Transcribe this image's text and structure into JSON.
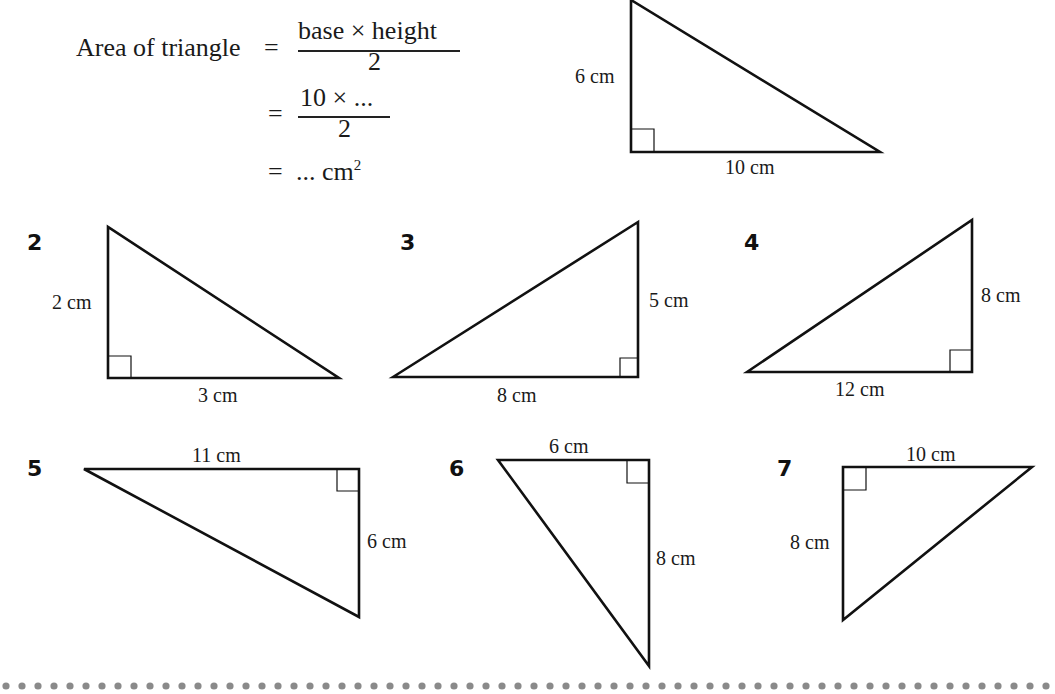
{
  "heading": {
    "text": "Copy and complete"
  },
  "worked_example": {
    "line1_label": "Area of triangle",
    "equals": "=",
    "line1_numerator": "base × height",
    "line1_denominator": "2",
    "line2_numerator": "10 × ...",
    "line2_denominator": "2",
    "line3_value": "... cm",
    "line3_superscript": "2"
  },
  "example_triangle": {
    "height_label": "6 cm",
    "base_label": "10 cm"
  },
  "questions": [
    {
      "number": "2",
      "labels": [
        "2 cm",
        "3 cm"
      ]
    },
    {
      "number": "3",
      "labels": [
        "5 cm",
        "8 cm"
      ]
    },
    {
      "number": "4",
      "labels": [
        "8 cm",
        "12 cm"
      ]
    },
    {
      "number": "5",
      "labels": [
        "11 cm",
        "6 cm"
      ]
    },
    {
      "number": "6",
      "labels": [
        "6 cm",
        "8 cm"
      ]
    },
    {
      "number": "7",
      "labels": [
        "10 cm",
        "8 cm"
      ]
    }
  ],
  "colors": {
    "line": "#111111",
    "dots": "#8a8a8a",
    "background": "#ffffff"
  }
}
